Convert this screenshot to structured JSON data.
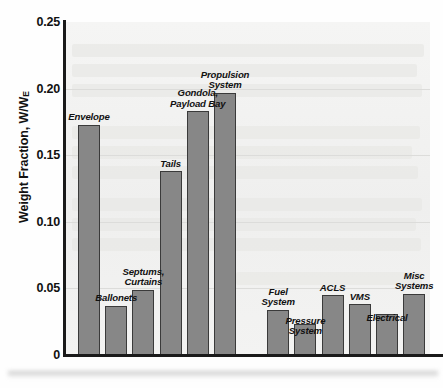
{
  "chart_data": {
    "type": "bar",
    "title": "",
    "xlabel": "",
    "ylabel": "Weight Fraction, W/W",
    "ylabel_sub": "E",
    "ylim": [
      0,
      0.25
    ],
    "yticks": [
      "0",
      "0.05",
      "0.10",
      "0.15",
      "0.20",
      "0.25"
    ],
    "ytick_values": [
      0,
      0.05,
      0.1,
      0.15,
      0.2,
      0.25
    ],
    "grid": true,
    "legend": "none",
    "categories": [
      "Envelope",
      "Ballonets",
      "Septums,\nCurtains",
      "Tails",
      "Gondola,\nPayload Bay",
      "Propulsion\nSystem",
      "Fuel\nSystem",
      "Pressure\nSystem",
      "ACLS",
      "VMS",
      "Electrical",
      "Misc\nSystems"
    ],
    "values": [
      0.173,
      0.037,
      0.049,
      0.138,
      0.183,
      0.197,
      0.034,
      0.023,
      0.045,
      0.038,
      0.031,
      0.046
    ],
    "bar_color": "#878787",
    "bar_edge_color": "#3a3a3a",
    "plot_background": "#f2f2f1",
    "axis_color": "#1a1a1a"
  }
}
